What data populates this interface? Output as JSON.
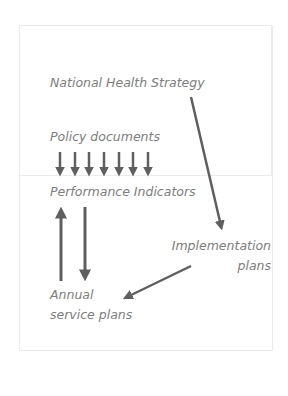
{
  "diagram": {
    "nodes": {
      "national_health_strategy": "National Health Strategy",
      "policy_documents": "Policy documents",
      "performance_indicators": "Performance Indicators",
      "implementation_plans_line1": "Implementation",
      "implementation_plans_line2": "plans",
      "annual_service_plans_line1": "Annual",
      "annual_service_plans_line2": "service plans"
    },
    "edges": [
      {
        "from": "National Health Strategy",
        "to": "Implementation plans"
      },
      {
        "from": "Policy documents",
        "to": "Performance Indicators",
        "count": 7
      },
      {
        "from": "Annual service plans",
        "to": "Performance Indicators"
      },
      {
        "from": "Performance Indicators",
        "to": "Annual service plans"
      },
      {
        "from": "Implementation plans",
        "to": "Annual service plans"
      }
    ],
    "colors": {
      "text": "#7d7d7d",
      "arrow": "#5f5f5f",
      "frame": "#ebebeb"
    }
  }
}
